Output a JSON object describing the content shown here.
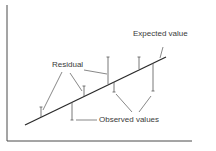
{
  "diagram": {
    "type": "regression-residuals-illustration",
    "labels": {
      "expected_value": "Expected value",
      "residual": "Residual",
      "observed_values": "Observed values"
    },
    "colors": {
      "line": "#2a2a2a",
      "axis": "#4a4a4a",
      "leader": "#555555",
      "text": "#3a3a3a",
      "background": "#ffffff"
    },
    "axes": {
      "x_axis": {
        "x1": 7,
        "y1": 141,
        "x2": 192,
        "y2": 141
      },
      "y_axis": {
        "x1": 7,
        "y1": 5,
        "x2": 7,
        "y2": 141
      }
    },
    "regression_line": {
      "x1": 25,
      "y1": 125,
      "x2": 166,
      "y2": 57
    },
    "residuals": [
      {
        "x": 41,
        "observed_y": 107,
        "expected_y": 117,
        "direction": "above"
      },
      {
        "x": 84,
        "observed_y": 86,
        "expected_y": 96,
        "direction": "above"
      },
      {
        "x": 72,
        "observed_y": 120,
        "expected_y": 102,
        "direction": "below"
      },
      {
        "x": 108,
        "observed_y": 57,
        "expected_y": 84,
        "direction": "above"
      },
      {
        "x": 114,
        "observed_y": 92,
        "expected_y": 82,
        "direction": "below"
      },
      {
        "x": 139,
        "observed_y": 57,
        "expected_y": 69,
        "direction": "above"
      },
      {
        "x": 153,
        "observed_y": 91,
        "expected_y": 63,
        "direction": "below"
      }
    ]
  }
}
